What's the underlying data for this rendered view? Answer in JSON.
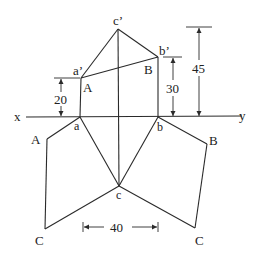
{
  "diagram": {
    "type": "orthographic-projection",
    "reference_line": {
      "left_label": "x",
      "right_label": "y"
    },
    "elevation_points": {
      "a": "a’",
      "b": "b’",
      "c": "c’"
    },
    "elevation_true_labels": {
      "A": "A",
      "B": "B"
    },
    "plan_points": {
      "a": "a",
      "b": "b",
      "c": "c"
    },
    "rotated_labels": {
      "A_left": "A",
      "C_left": "C",
      "B_right": "B",
      "C_right": "C"
    },
    "dimensions": {
      "a_height": "20",
      "b_height": "30",
      "c_height": "45",
      "horizontal": "40"
    }
  }
}
